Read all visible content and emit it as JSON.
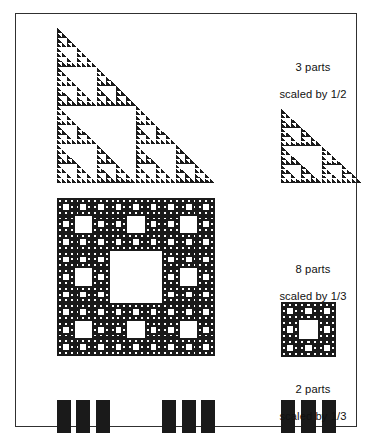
{
  "figure": {
    "background_color": "#ffffff",
    "ink_color": "#1a1a1a",
    "frame_color": "#303030"
  },
  "captions": [
    {
      "id": "triangle",
      "line1": "3 parts",
      "line2": "scaled by 1/2",
      "parts": 3,
      "scale": "1/2"
    },
    {
      "id": "carpet",
      "line1": "8 parts",
      "line2": "scaled by 1/3",
      "parts": 8,
      "scale": "1/3"
    },
    {
      "id": "cantor",
      "line1": "2 parts",
      "line2": "scaled by 1/3",
      "parts": 2,
      "scale": "1/3"
    }
  ],
  "fractals": {
    "sierpinski_triangle_large": {
      "name": "Sierpinski triangle",
      "depth": 5,
      "orientation": "right-angle-bottom-left"
    },
    "sierpinski_triangle_small": {
      "name": "Sierpinski triangle (scaled copy)",
      "depth": 4,
      "orientation": "right-angle-bottom-left"
    },
    "sierpinski_carpet_large": {
      "name": "Sierpinski carpet",
      "depth": 4,
      "grid": 3
    },
    "sierpinski_carpet_small": {
      "name": "Sierpinski carpet (scaled copy)",
      "depth": 3,
      "grid": 3
    },
    "cantor_set_large": {
      "name": "Cantor set bars",
      "depth": 2,
      "bars": 12
    },
    "cantor_set_small": {
      "name": "Cantor set bars (scaled copy)",
      "depth": 2,
      "bars": 6
    }
  }
}
